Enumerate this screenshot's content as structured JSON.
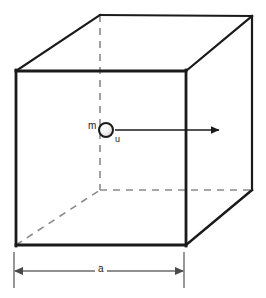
{
  "figure": {
    "name": "cube-with-particle",
    "background_color": "#ffffff",
    "line_color": "#1a1a1a",
    "dashed_color": "#8a8a8a",
    "dimension_color": "#6b6b6b",
    "labels": {
      "mass": "m",
      "velocity": "u",
      "side_length": "a"
    },
    "geometry": {
      "front_face": {
        "top_left": [
          16,
          71
        ],
        "top_right": [
          186,
          71
        ],
        "bottom_right": [
          186,
          245
        ],
        "bottom_left": [
          16,
          245
        ]
      },
      "back_face": {
        "top_left": [
          100,
          15
        ],
        "top_right": [
          252,
          16
        ],
        "bottom_right": [
          252,
          190
        ],
        "bottom_left": [
          100,
          190
        ]
      },
      "particle": {
        "center": [
          106,
          130
        ],
        "radius": 7
      },
      "velocity_arrow": {
        "start": [
          115,
          130
        ],
        "end": [
          220,
          130
        ]
      },
      "dimension_line": {
        "y": 271,
        "x_start": 14,
        "x_end": 184,
        "extension_top": 252,
        "extension_bottom": 288
      }
    }
  }
}
